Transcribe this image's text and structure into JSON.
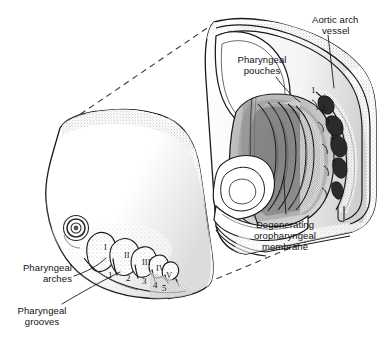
{
  "figure": {
    "ink_color": "#1a1a1a",
    "background_color": "#ffffff",
    "stipple_color": "#6a6a6a"
  },
  "labels": {
    "aortic_arch_vessel": "Aortic arch\nvessel",
    "aortic_arch_vessel_line1": "Aortic arch",
    "aortic_arch_vessel_line2": "vessel",
    "pharyngeal_pouches_line1": "Pharyngeal",
    "pharyngeal_pouches_line2": "pouches",
    "degenerating_line1": "Degenerating",
    "degenerating_line2": "oropharyngeal",
    "degenerating_line3": "membrane",
    "pharyngeal_arches_line1": "Pharyngeal",
    "pharyngeal_arches_line2": "arches",
    "pharyngeal_grooves_line1": "Pharyngeal",
    "pharyngeal_grooves_line2": "grooves"
  },
  "embryo_arch_numerals": {
    "roman": [
      "I",
      "II",
      "III",
      "IV",
      "V"
    ],
    "arabic": [
      "1",
      "2",
      "3",
      "4",
      "5"
    ]
  },
  "pouch_numbers": [
    "1",
    "2",
    "3",
    "4",
    "5"
  ]
}
